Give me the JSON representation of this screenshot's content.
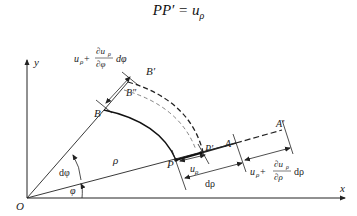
{
  "title_parts": {
    "lhs": "PP′",
    "eq": " = ",
    "rhs_u": "u",
    "rhs_sub": "ρ"
  },
  "labels": {
    "origin": "O",
    "x_axis": "x",
    "y_axis": "y",
    "rho": "ρ",
    "phi": "φ",
    "dphi": "dφ",
    "P": "P",
    "P_prime": "P′",
    "A": "A",
    "A_prime": "A′",
    "B": "B",
    "B_prime": "B′",
    "B_double_prime": "B″",
    "u_rho_u": "u",
    "u_rho_sub": "ρ",
    "d_rho": "dρ"
  },
  "annotations": {
    "tangential": {
      "u": "u",
      "sub": "ρ",
      "plus": " + ",
      "num": "∂u",
      "num_sub": "ρ",
      "den": "∂φ",
      "tail": "dφ"
    },
    "radial": {
      "u": "u",
      "sub": "ρ",
      "plus": " + ",
      "num": "∂u",
      "num_sub": "ρ",
      "den": "∂ρ",
      "tail": "dρ"
    }
  },
  "colors": {
    "stroke": "#222222",
    "dashed_light": "#777777",
    "background": "#ffffff"
  }
}
